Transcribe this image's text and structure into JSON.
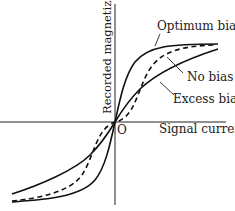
{
  "diagram": {
    "axes": {
      "x_label": "Signal current",
      "y_label": "Recorded magnetization",
      "origin_label": "O"
    },
    "curves": [
      {
        "id": "optimum",
        "label": "Optimum bias",
        "style": "solid",
        "description": "steep linear region through origin, saturates sharply"
      },
      {
        "id": "none",
        "label": "No bias",
        "style": "dashed",
        "description": "S-shaped with dead zone near origin (crossover distortion)"
      },
      {
        "id": "excess",
        "label": "Excess bias",
        "style": "solid",
        "description": "gentle slope, reduced sensitivity"
      }
    ]
  }
}
